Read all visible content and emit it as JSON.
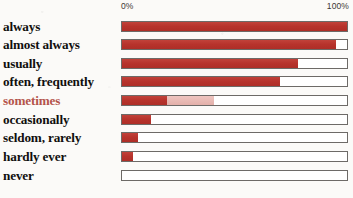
{
  "axis": {
    "min_label": "0%",
    "max_label": "100%"
  },
  "colors": {
    "bar_fill": "#b7332c",
    "bar_fill_soft": "#e8b9b3",
    "track_border": "#6d6a67",
    "track_background": "#ffffff",
    "label_text": "#100f0e",
    "accent_label_text": "#b4544b",
    "page_background": "#fbfaf8"
  },
  "chart_data": {
    "type": "bar",
    "orientation": "horizontal",
    "title": "",
    "xlabel": "",
    "ylabel": "",
    "xlim": [
      0,
      100
    ],
    "tick_labels": [
      "0%",
      "100%"
    ],
    "grid": false,
    "legend": null,
    "categories": [
      "always",
      "almost always",
      "usually",
      "often, frequently",
      "sometimes",
      "occasionally",
      "seldom, rarely",
      "hardly ever",
      "never"
    ],
    "values": [
      100,
      95,
      78,
      70,
      20,
      13,
      7,
      5,
      0
    ],
    "series": [
      {
        "name": "frequency",
        "values": [
          100,
          95,
          78,
          70,
          20,
          13,
          7,
          5,
          0
        ]
      },
      {
        "name": "range-extension",
        "values": [
          0,
          0,
          0,
          0,
          41,
          0,
          0,
          0,
          0
        ]
      }
    ],
    "highlight_category": "sometimes"
  },
  "rows": [
    {
      "label": "always",
      "value": 100,
      "soft_value": 0,
      "highlight": false
    },
    {
      "label": "almost always",
      "value": 95,
      "soft_value": 0,
      "highlight": false
    },
    {
      "label": "usually",
      "value": 78,
      "soft_value": 0,
      "highlight": false
    },
    {
      "label": "often, frequently",
      "value": 70,
      "soft_value": 0,
      "highlight": false
    },
    {
      "label": "sometimes",
      "value": 20,
      "soft_value": 41,
      "highlight": true
    },
    {
      "label": "occasionally",
      "value": 13,
      "soft_value": 0,
      "highlight": false
    },
    {
      "label": "seldom, rarely",
      "value": 7,
      "soft_value": 0,
      "highlight": false
    },
    {
      "label": "hardly ever",
      "value": 5,
      "soft_value": 0,
      "highlight": false
    },
    {
      "label": "never",
      "value": 0,
      "soft_value": 0,
      "highlight": false
    }
  ]
}
